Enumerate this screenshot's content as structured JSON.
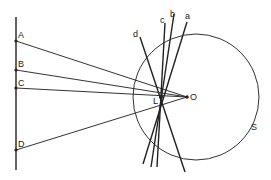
{
  "diagram": {
    "type": "geometric ray diagram",
    "points": [
      {
        "label": "A",
        "x": 16,
        "y": 41
      },
      {
        "label": "B",
        "x": 16,
        "y": 70
      },
      {
        "label": "C",
        "x": 16,
        "y": 88
      },
      {
        "label": "D",
        "x": 16,
        "y": 150
      },
      {
        "label": "O",
        "x": 187,
        "y": 97
      },
      {
        "label": "L",
        "x": 161,
        "y": 97
      }
    ],
    "lines": [
      {
        "label": "a"
      },
      {
        "label": "b"
      },
      {
        "label": "c"
      },
      {
        "label": "d"
      }
    ],
    "circle": {
      "label": "S"
    }
  }
}
